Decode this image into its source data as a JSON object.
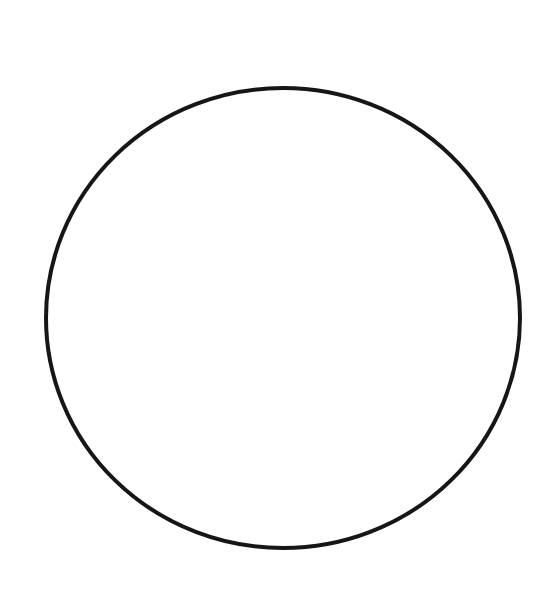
{
  "canvas": {
    "width": 558,
    "height": 615,
    "background": "#ffffff"
  },
  "shape": {
    "type": "ellipse",
    "cx": 283,
    "cy": 318,
    "rx": 237,
    "ry": 230,
    "stroke": "#161616",
    "stroke_width": 4,
    "fill": "none"
  }
}
